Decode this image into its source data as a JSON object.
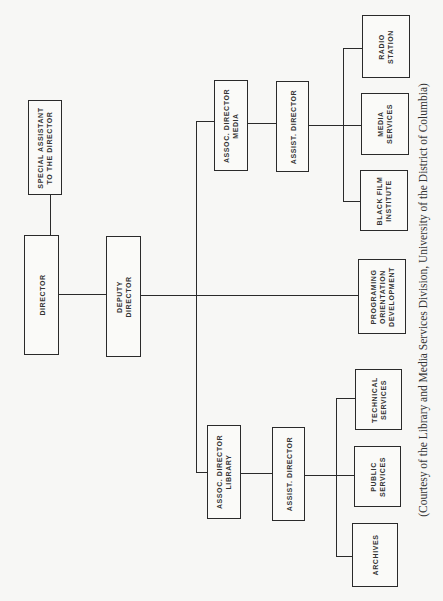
{
  "chart": {
    "type": "org-chart",
    "orientation": "rotated-90-ccw",
    "nodes": {
      "special_assistant": "SPECIAL ASSISTANT\nTO THE DIRECTOR",
      "director": "DIRECTOR",
      "deputy_director": "DEPUTY\nDIRECTOR",
      "assoc_director_media": "ASSOC. DIRECTOR\nMEDIA",
      "assist_director_media": "ASSIST. DIRECTOR",
      "radio_station": "RADIO\nSTATION",
      "media_services": "MEDIA\nSERVICES",
      "black_film_institute": "BLACK FILM\nINSTITUTE",
      "programing": "PROGRAMING\nORIENTATION\nDEVELOPMENT",
      "assoc_director_library": "ASSOC. DIRECTOR\nLIBRARY",
      "assist_director_library": "ASSIST. DIRECTOR",
      "technical_services": "TECHNICAL\nSERVICES",
      "public_services": "PUBLIC\nSERVICES",
      "archives": "ARCHIVES"
    },
    "edges": [
      [
        "director",
        "special_assistant"
      ],
      [
        "director",
        "deputy_director"
      ],
      [
        "deputy_director",
        "assoc_director_media"
      ],
      [
        "deputy_director",
        "programing"
      ],
      [
        "deputy_director",
        "assoc_director_library"
      ],
      [
        "assoc_director_media",
        "assist_director_media"
      ],
      [
        "assist_director_media",
        "radio_station"
      ],
      [
        "assist_director_media",
        "media_services"
      ],
      [
        "assist_director_media",
        "black_film_institute"
      ],
      [
        "assoc_director_library",
        "assist_director_library"
      ],
      [
        "assist_director_library",
        "technical_services"
      ],
      [
        "assist_director_library",
        "public_services"
      ],
      [
        "assist_director_library",
        "archives"
      ]
    ],
    "caption": "(Courtesy of the Library and Media Services Division, University of the District of Columbia)"
  }
}
